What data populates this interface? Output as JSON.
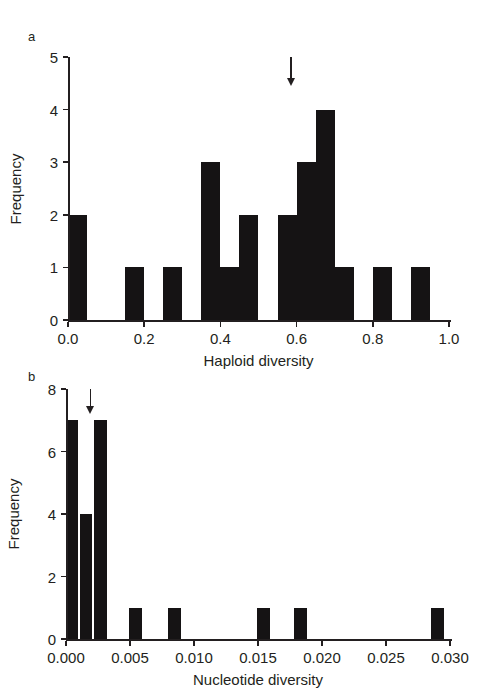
{
  "figure": {
    "background": "#ffffff",
    "ink_color": "#231f20",
    "bar_color": "#151314"
  },
  "panels": [
    {
      "letter": "a",
      "chart_data": {
        "type": "bar",
        "title": "",
        "xlabel": "Haploid diversity",
        "ylabel": "Frequency",
        "xlim": [
          0.0,
          1.0
        ],
        "ylim": [
          0,
          5
        ],
        "xticks": [
          0.0,
          0.2,
          0.4,
          0.6,
          0.8,
          1.0
        ],
        "xticklabels": [
          "0.0",
          "0.2",
          "0.4",
          "0.6",
          "0.8",
          "1.0"
        ],
        "yticks": [
          0,
          1,
          2,
          3,
          4,
          5
        ],
        "yticklabels": [
          "0",
          "1",
          "2",
          "3",
          "4",
          "5"
        ],
        "grid": false,
        "legend": false,
        "bin_width": 0.05,
        "bins": [
          {
            "x0": 0.0,
            "x1": 0.05,
            "value": 2
          },
          {
            "x0": 0.15,
            "x1": 0.2,
            "value": 1
          },
          {
            "x0": 0.25,
            "x1": 0.3,
            "value": 1
          },
          {
            "x0": 0.35,
            "x1": 0.4,
            "value": 3
          },
          {
            "x0": 0.4,
            "x1": 0.45,
            "value": 1
          },
          {
            "x0": 0.45,
            "x1": 0.5,
            "value": 2
          },
          {
            "x0": 0.55,
            "x1": 0.6,
            "value": 2
          },
          {
            "x0": 0.6,
            "x1": 0.65,
            "value": 3
          },
          {
            "x0": 0.65,
            "x1": 0.7,
            "value": 4
          },
          {
            "x0": 0.7,
            "x1": 0.75,
            "value": 1
          },
          {
            "x0": 0.8,
            "x1": 0.85,
            "value": 1
          },
          {
            "x0": 0.9,
            "x1": 0.95,
            "value": 1
          }
        ],
        "annotations": [
          {
            "type": "arrow",
            "x": 0.585,
            "y_from": 5.0,
            "y_to": 4.45,
            "direction": "down"
          }
        ]
      }
    },
    {
      "letter": "b",
      "chart_data": {
        "type": "bar",
        "title": "",
        "xlabel": "Nucleotide diversity",
        "ylabel": "Frequency",
        "xlim": [
          0.0,
          0.03
        ],
        "ylim": [
          0,
          8
        ],
        "xticks": [
          0.0,
          0.005,
          0.01,
          0.015,
          0.02,
          0.025,
          0.03
        ],
        "xticklabels": [
          "0.000",
          "0.005",
          "0.010",
          "0.015",
          "0.020",
          "0.025",
          "0.030"
        ],
        "yticks": [
          0,
          2,
          4,
          6,
          8
        ],
        "yticklabels": [
          "0",
          "2",
          "4",
          "6",
          "8"
        ],
        "grid": false,
        "legend": false,
        "bin_width": 0.0011,
        "bins": [
          {
            "x0": 0.0,
            "x1": 0.0009,
            "value": 7
          },
          {
            "x0": 0.0011,
            "x1": 0.002,
            "value": 4
          },
          {
            "x0": 0.0022,
            "x1": 0.0032,
            "value": 7
          },
          {
            "x0": 0.0049,
            "x1": 0.0059,
            "value": 1
          },
          {
            "x0": 0.008,
            "x1": 0.009,
            "value": 1
          },
          {
            "x0": 0.0149,
            "x1": 0.0159,
            "value": 1
          },
          {
            "x0": 0.0178,
            "x1": 0.0188,
            "value": 1
          },
          {
            "x0": 0.0285,
            "x1": 0.0295,
            "value": 1
          }
        ],
        "annotations": [
          {
            "type": "arrow",
            "x": 0.0019,
            "y_from": 8.0,
            "y_to": 7.2,
            "direction": "down"
          }
        ]
      }
    }
  ]
}
